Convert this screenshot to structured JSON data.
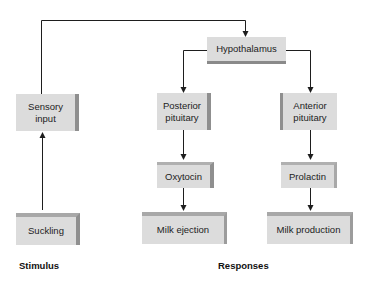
{
  "diagram": {
    "nodes": {
      "hypothalamus": "Hypothalamus",
      "sensory_input": [
        "Sensory",
        "input"
      ],
      "posterior_pituitary": [
        "Posterior",
        "pituitary"
      ],
      "anterior_pituitary": [
        "Anterior",
        "pituitary"
      ],
      "oxytocin": "Oxytocin",
      "prolactin": "Prolactin",
      "suckling": "Suckling",
      "milk_ejection": "Milk ejection",
      "milk_production": "Milk production"
    },
    "edges": [
      {
        "from": "suckling",
        "to": "sensory_input"
      },
      {
        "from": "sensory_input",
        "to": "hypothalamus"
      },
      {
        "from": "hypothalamus",
        "to": "posterior_pituitary"
      },
      {
        "from": "hypothalamus",
        "to": "anterior_pituitary"
      },
      {
        "from": "posterior_pituitary",
        "to": "oxytocin"
      },
      {
        "from": "oxytocin",
        "to": "milk_ejection"
      },
      {
        "from": "anterior_pituitary",
        "to": "prolactin"
      },
      {
        "from": "prolactin",
        "to": "milk_production"
      }
    ],
    "section_labels": {
      "stimulus": "Stimulus",
      "responses": "Responses"
    },
    "colors": {
      "box_fill": "#dcdcdc",
      "box_shade": "#8f8f8f",
      "line": "#1e1e1e"
    }
  }
}
